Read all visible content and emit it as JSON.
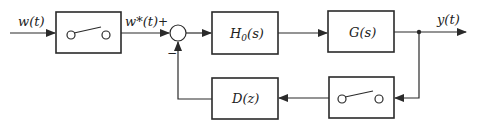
{
  "diagram": {
    "type": "sampled-data control system block diagram",
    "input_signal": "w(t)",
    "sampled_signal": "w*(t)",
    "output_signal": "y(t)",
    "summing_junction": {
      "plus_sign": "+",
      "minus_sign": "−"
    },
    "blocks": [
      {
        "id": "sampler-in",
        "label": "",
        "kind": "sampler-switch"
      },
      {
        "id": "hold",
        "label_main": "H",
        "label_sub": "0",
        "label_tail": "(s)"
      },
      {
        "id": "plant",
        "label": "G(s)"
      },
      {
        "id": "sampler-fb",
        "label": "",
        "kind": "sampler-switch"
      },
      {
        "id": "controller",
        "label": "D(z)"
      }
    ],
    "colors": {
      "line": "#2a2a2a",
      "background": "#ffffff"
    }
  }
}
